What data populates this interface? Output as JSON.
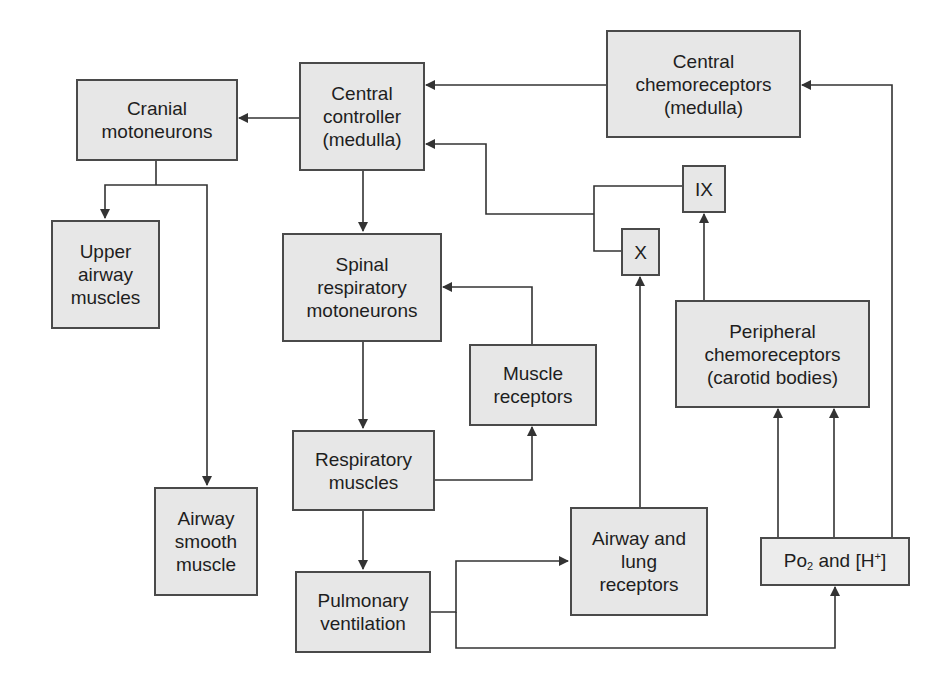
{
  "diagram": {
    "title": "",
    "nodes": {
      "cranial": {
        "label": "Cranial\nmotoneurons"
      },
      "central_controller": {
        "label": "Central\ncontroller\n(medulla)"
      },
      "central_chemo": {
        "label": "Central\nchemoreceptors\n(medulla)"
      },
      "upper_airway": {
        "label": "Upper\nairway\nmuscles"
      },
      "spinal": {
        "label": "Spinal\nrespiratory\nmotoneurons"
      },
      "ix": {
        "label": "IX"
      },
      "x": {
        "label": "X"
      },
      "muscle_receptors": {
        "label": "Muscle\nreceptors"
      },
      "peripheral_chemo": {
        "label": "Peripheral\nchemoreceptors\n(carotid bodies)"
      },
      "respiratory_muscles": {
        "label": "Respiratory\nmuscles"
      },
      "airway_smooth": {
        "label": "Airway\nsmooth\nmuscle"
      },
      "airway_lung": {
        "label": "Airway and\nlung\nreceptors"
      },
      "pulmonary": {
        "label": "Pulmonary\nventilation"
      },
      "po2": {
        "pre": "Po",
        "sub": "2",
        "mid": " and [H",
        "sup": "+",
        "post": "]"
      }
    },
    "edges": [
      {
        "from": "central_chemo",
        "to": "central_controller"
      },
      {
        "from": "central_controller",
        "to": "cranial"
      },
      {
        "from": "cranial",
        "to": "upper_airway"
      },
      {
        "from": "cranial",
        "to": "airway_smooth"
      },
      {
        "from": "central_controller",
        "to": "spinal"
      },
      {
        "from": "ix",
        "to": "central_controller"
      },
      {
        "from": "x",
        "to": "central_controller"
      },
      {
        "from": "muscle_receptors",
        "to": "spinal"
      },
      {
        "from": "spinal",
        "to": "respiratory_muscles"
      },
      {
        "from": "respiratory_muscles",
        "to": "muscle_receptors"
      },
      {
        "from": "respiratory_muscles",
        "to": "pulmonary"
      },
      {
        "from": "pulmonary",
        "to": "airway_lung"
      },
      {
        "from": "pulmonary",
        "to": "po2"
      },
      {
        "from": "airway_lung",
        "to": "x"
      },
      {
        "from": "peripheral_chemo",
        "to": "ix"
      },
      {
        "from": "po2",
        "to": "peripheral_chemo"
      },
      {
        "from": "po2",
        "to": "central_chemo"
      }
    ],
    "colors": {
      "box_fill": "#e7e7e7",
      "border": "#4a4a4a",
      "line": "#333333",
      "text": "#1e1e1e"
    }
  }
}
